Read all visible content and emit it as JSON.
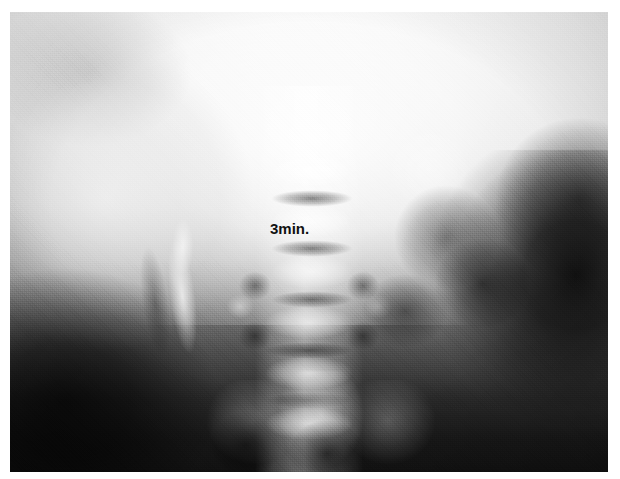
{
  "image": {
    "kind": "radiograph",
    "modality_hint": "abdominal-x-ray",
    "alt": "Grayscale abdominal radiograph",
    "background_color": "#ffffff",
    "plate": {
      "left": 10,
      "top": 12,
      "width": 598,
      "height": 460,
      "border_color": "#ffffff"
    }
  },
  "annotations": {
    "timing_label": {
      "text": "3min.",
      "color": "#111111",
      "x": 270,
      "y": 220,
      "font_size_px": 15,
      "weight": "bold"
    }
  },
  "tones": {
    "highlight": "#f4f4f4",
    "midtone": "#a8a8a8",
    "shadow": "#2c2c2c",
    "deep_shadow": "#141414"
  },
  "regions": [
    {
      "name": "upper-abdomen-bright-field",
      "tone": "highlight"
    },
    {
      "name": "left-flank-soft-tissue",
      "tone": "highlight"
    },
    {
      "name": "lumbar-spine-column",
      "tone": "midtone"
    },
    {
      "name": "contrast-filled-collecting-system",
      "tone": "highlight"
    },
    {
      "name": "right-bowel-gas-shadow",
      "tone": "deep_shadow"
    },
    {
      "name": "left-lower-quadrant-gas",
      "tone": "deep_shadow"
    },
    {
      "name": "sacrum-pelvis",
      "tone": "midtone"
    }
  ]
}
